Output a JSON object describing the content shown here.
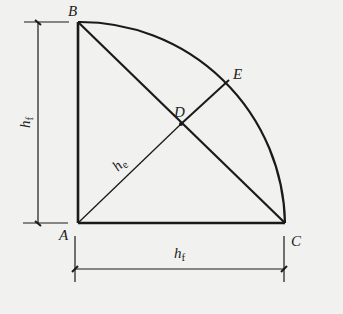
{
  "diagram": {
    "type": "fillet weld cross-section (quarter-circle) geometry",
    "points": {
      "A": {
        "label": "A",
        "x": 78,
        "y": 223
      },
      "B": {
        "label": "B",
        "x": 78,
        "y": 22
      },
      "C": {
        "label": "C",
        "x": 285,
        "y": 223
      },
      "D": {
        "label": "D",
        "x": 181,
        "y": 124
      },
      "E": {
        "label": "E",
        "x": 229,
        "y": 80
      }
    },
    "labels": {
      "vertical_dimension": "h",
      "vertical_dimension_sub": "f",
      "horizontal_dimension": "h",
      "horizontal_dimension_sub": "f",
      "throat": "h",
      "throat_sub": "e"
    },
    "colors": {
      "background": "#f1f1f0",
      "line": "#1a1a1a"
    }
  }
}
